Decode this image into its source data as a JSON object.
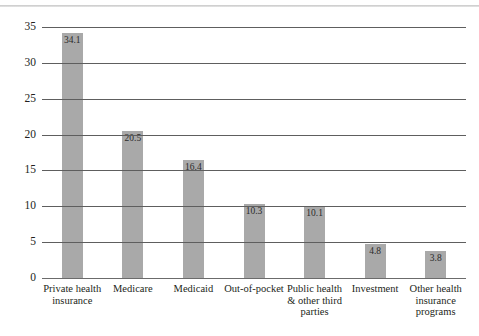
{
  "chart_data": {
    "type": "bar",
    "title": "",
    "xlabel": "",
    "ylabel": "",
    "ylim": [
      0,
      35
    ],
    "ytick_step": 5,
    "yticks": [
      "35",
      "30",
      "25",
      "20",
      "15",
      "10",
      "5",
      "0"
    ],
    "grid": true,
    "legend": "none",
    "bar_color": "#a9a9a9",
    "categories": [
      "Private health insurance",
      "Medicare",
      "Medicaid",
      "Out-of-pocket",
      "Public health & other third parties",
      "Investment",
      "Other health insurance programs"
    ],
    "category_lines": [
      [
        "Private health",
        "insurance"
      ],
      [
        "Medicare"
      ],
      [
        "Medicaid"
      ],
      [
        "Out-of-pocket"
      ],
      [
        "Public health",
        "& other third",
        "parties"
      ],
      [
        "Investment"
      ],
      [
        "Other health",
        "insurance",
        "programs"
      ]
    ],
    "values": [
      34.1,
      20.5,
      16.4,
      10.3,
      10.1,
      4.8,
      3.8
    ],
    "value_labels": [
      "34.1",
      "20.5",
      "16.4",
      "10.3",
      "10.1",
      "4.8",
      "3.8"
    ]
  }
}
